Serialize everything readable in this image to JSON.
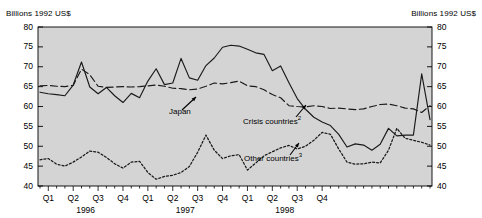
{
  "axis_unit_label_left": "Billions 1992 US$",
  "axis_unit_label_right": "Billions 1992 US$",
  "annotations": {
    "japan": "Japan",
    "crisis": "Crisis countries",
    "crisis_sup": "2",
    "other": "Other countries",
    "other_sup": "3"
  },
  "chart_data": {
    "type": "line",
    "title": "",
    "subtitle": "",
    "xlabel": "",
    "ylabel": "Billions 1992 US$",
    "ylim": [
      40,
      80
    ],
    "ytick_values": [
      40,
      45,
      50,
      55,
      60,
      65,
      70,
      75,
      80
    ],
    "ytick_labels": [
      "40",
      "45",
      "50",
      "55",
      "60",
      "65",
      "70",
      "75",
      "80"
    ],
    "y_axis_right": true,
    "grid": false,
    "plot_background": "#d4d4d4",
    "legend_position": "inline-annotations",
    "x_type": "monthly",
    "x_range": [
      "1996-01",
      "1998-12"
    ],
    "quarter_ticks": [
      {
        "label": "Q1",
        "year": "1996",
        "month_index": 1
      },
      {
        "label": "Q2",
        "year": "1996",
        "month_index": 4
      },
      {
        "label": "Q3",
        "year": "1996",
        "month_index": 7
      },
      {
        "label": "Q4",
        "year": "1996",
        "month_index": 10
      },
      {
        "label": "Q1",
        "year": "1997",
        "month_index": 13
      },
      {
        "label": "Q2",
        "year": "1997",
        "month_index": 16
      },
      {
        "label": "Q3",
        "year": "1997",
        "month_index": 19
      },
      {
        "label": "Q4",
        "year": "1997",
        "month_index": 22
      },
      {
        "label": "Q1",
        "year": "1998",
        "month_index": 25
      },
      {
        "label": "Q2",
        "year": "1998",
        "month_index": 28
      },
      {
        "label": "Q3",
        "year": "1998",
        "month_index": 31
      },
      {
        "label": "Q4",
        "year": "1998",
        "month_index": 34
      }
    ],
    "year_labels": [
      {
        "label": "1996",
        "month_index": 5.5
      },
      {
        "label": "1997",
        "month_index": 17.5
      },
      {
        "label": "1998",
        "month_index": 29.5
      }
    ],
    "series": [
      {
        "name": "Crisis countries",
        "style": "solid",
        "color": "#1a1a1a",
        "values": [
          63.6,
          63.2,
          63.0,
          62.7,
          65.4,
          71.2,
          64.9,
          63.2,
          64.8,
          62.7,
          61.0,
          63.3,
          62.2,
          66.4,
          69.5,
          65.5,
          65.9,
          72.1,
          67.2,
          66.6,
          70.3,
          72.2,
          74.9,
          75.4,
          75.2,
          74.4,
          73.5,
          73.1,
          69.0,
          70.2,
          66.0,
          62.0,
          59.3,
          57.3,
          56.1,
          55.2
        ]
      },
      {
        "name": "Japan",
        "style": "dashed",
        "color": "#1a1a1a",
        "values": [
          65.2,
          65.3,
          65.1,
          65.0,
          65.3,
          69.4,
          68.0,
          65.1,
          64.8,
          64.9,
          65.0,
          64.9,
          65.0,
          65.2,
          65.4,
          65.1,
          64.6,
          64.5,
          64.2,
          64.4,
          65.1,
          65.9,
          65.7,
          66.0,
          66.4,
          65.2,
          65.0,
          64.2,
          63.0,
          62.2,
          60.2,
          60.0,
          59.9,
          60.2,
          60.0,
          59.5
        ]
      },
      {
        "name": "Other countries",
        "style": "dotted",
        "color": "#1a1a1a",
        "values": [
          46.6,
          46.9,
          45.5,
          45.0,
          46.0,
          47.3,
          48.8,
          48.5,
          47.2,
          45.6,
          44.5,
          46.0,
          46.2,
          43.4,
          41.7,
          42.4,
          42.7,
          43.4,
          44.9,
          48.5,
          52.8,
          49.0,
          46.9,
          47.6,
          47.9,
          44.0,
          45.8,
          47.6,
          48.6,
          49.6,
          50.2,
          49.3,
          50.0,
          51.5,
          53.5,
          53.0
        ]
      }
    ],
    "series_continuation": {
      "note": "Series continue past the Q4-1998 quarter tick to the plot right edge",
      "Crisis countries": [
        53.0,
        49.8,
        50.6,
        50.3,
        49.0,
        50.5,
        54.5,
        52.6,
        52.8,
        52.8,
        68.2,
        56.7
      ],
      "Japan": [
        59.6,
        59.4,
        59.2,
        59.4,
        60.0,
        60.5,
        60.6,
        60.2,
        59.6,
        59.4,
        58.5,
        60.2
      ],
      "Other countries": [
        49.3,
        46.0,
        45.5,
        45.6,
        46.0,
        45.8,
        49.0,
        54.5,
        52.0,
        51.5,
        51.0,
        50.3
      ]
    }
  }
}
